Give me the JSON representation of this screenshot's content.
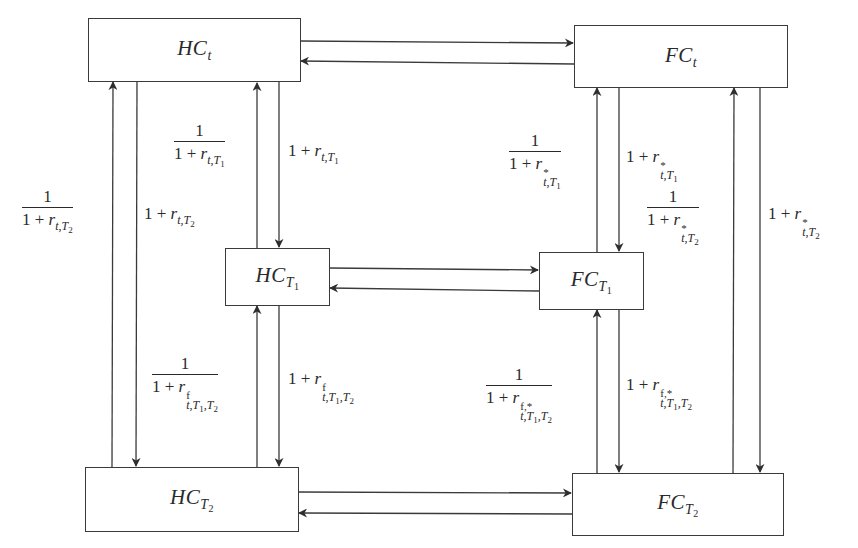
{
  "diagram": {
    "type": "currency-interest-rate-parity-flow",
    "nodes": {
      "hc_t": {
        "base": "HC",
        "sub": "t",
        "subsub": ""
      },
      "fc_t": {
        "base": "FC",
        "sub": "t",
        "subsub": ""
      },
      "hc_t1": {
        "base": "HC",
        "sub": "T",
        "subsub": "1"
      },
      "fc_t1": {
        "base": "FC",
        "sub": "T",
        "subsub": "1"
      },
      "hc_t2": {
        "base": "HC",
        "sub": "T",
        "subsub": "2"
      },
      "fc_t2": {
        "base": "FC",
        "sub": "T",
        "subsub": "2"
      }
    },
    "edges": [
      {
        "from": "hc_t",
        "to": "fc_t"
      },
      {
        "from": "fc_t",
        "to": "hc_t"
      },
      {
        "from": "hc_t1",
        "to": "fc_t1"
      },
      {
        "from": "fc_t1",
        "to": "hc_t1"
      },
      {
        "from": "hc_t2",
        "to": "fc_t2"
      },
      {
        "from": "fc_t2",
        "to": "hc_t2"
      },
      {
        "from": "hc_t",
        "to": "hc_t1",
        "label": "1 + r_{t,T1}"
      },
      {
        "from": "hc_t1",
        "to": "hc_t",
        "label": "1 / (1 + r_{t,T1})"
      },
      {
        "from": "hc_t",
        "to": "hc_t2",
        "label": "1 + r_{t,T2}"
      },
      {
        "from": "hc_t2",
        "to": "hc_t",
        "label": "1 / (1 + r_{t,T2})"
      },
      {
        "from": "hc_t1",
        "to": "hc_t2",
        "label": "1 + r^f_{t,T1,T2}"
      },
      {
        "from": "hc_t2",
        "to": "hc_t1",
        "label": "1 / (1 + r^f_{t,T1,T2})"
      },
      {
        "from": "fc_t",
        "to": "fc_t1",
        "label": "1 + r*_{t,T1}"
      },
      {
        "from": "fc_t1",
        "to": "fc_t",
        "label": "1 / (1 + r*_{t,T1})"
      },
      {
        "from": "fc_t",
        "to": "fc_t2",
        "label": "1 + r*_{t,T2}"
      },
      {
        "from": "fc_t2",
        "to": "fc_t",
        "label": "1 / (1 + r*_{t,T2})"
      },
      {
        "from": "fc_t1",
        "to": "fc_t2",
        "label": "1 + r^{f,*}_{t,T1,T2}"
      },
      {
        "from": "fc_t2",
        "to": "fc_t1",
        "label": "1 / (1 + r^{f,*}_{t,T1,T2})"
      }
    ]
  },
  "labels": {
    "one": "1",
    "one_plus": "1 + ",
    "r": "r",
    "t": "t",
    "comma": ",",
    "T": "T",
    "n1": "1",
    "n2": "2",
    "star": "*",
    "f": "f",
    "f_star": "f,*"
  }
}
